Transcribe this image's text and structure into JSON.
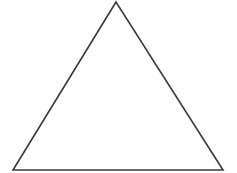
{
  "canvas": {
    "width": 237,
    "height": 173,
    "background": "#ffffff"
  },
  "shape": {
    "type": "triangle",
    "kind": "equilateral-outline",
    "vertices": [
      [
        116,
        2
      ],
      [
        13,
        170
      ],
      [
        223,
        170
      ]
    ],
    "stroke_color": "#3a3a3a",
    "stroke_width": 1.6,
    "fill": "none"
  }
}
